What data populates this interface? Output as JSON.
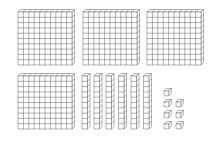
{
  "diagram": {
    "stroke_color": "#555555",
    "fill_color": "#ffffff",
    "hundreds": {
      "count": 4,
      "grid": 10
    },
    "tens": {
      "count": 6,
      "cells": 10
    },
    "ones": {
      "count": 7
    },
    "represented_value": 467
  }
}
